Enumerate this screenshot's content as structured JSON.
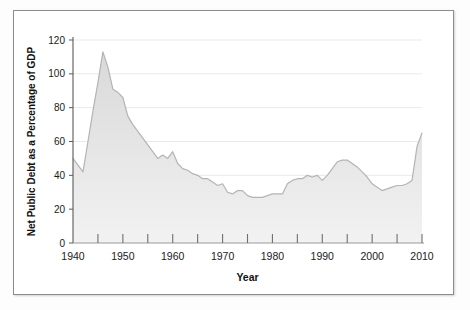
{
  "chart_data": {
    "type": "area",
    "title": "",
    "xlabel": "Year",
    "ylabel": "Net Public Debt as a Percentage of GDP",
    "xlim": [
      1940,
      2010
    ],
    "ylim": [
      0,
      120
    ],
    "grid": true,
    "legend_position": "none",
    "xticks": [
      1940,
      1950,
      1960,
      1970,
      1980,
      1990,
      2000,
      2010
    ],
    "xtick_labels": [
      "1940",
      "1950",
      "1960",
      "1970",
      "1980",
      "1990",
      "2000",
      "2010"
    ],
    "xminor_ticks": [
      1945,
      1955,
      1965,
      1975,
      1985,
      1995,
      2005
    ],
    "yticks": [
      0,
      20,
      40,
      60,
      80,
      100,
      120
    ],
    "ytick_labels": [
      "0",
      "20",
      "40",
      "60",
      "80",
      "100",
      "120"
    ],
    "series": [
      {
        "name": "Net Public Debt as a Percentage of GDP",
        "fill_color": "#e6e6e6",
        "line_color": "#b0b0b0",
        "x": [
          1940,
          1941,
          1942,
          1943,
          1944,
          1945,
          1946,
          1947,
          1948,
          1949,
          1950,
          1951,
          1952,
          1953,
          1954,
          1955,
          1956,
          1957,
          1958,
          1959,
          1960,
          1961,
          1962,
          1963,
          1964,
          1965,
          1966,
          1967,
          1968,
          1969,
          1970,
          1971,
          1972,
          1973,
          1974,
          1975,
          1976,
          1977,
          1978,
          1979,
          1980,
          1981,
          1982,
          1983,
          1984,
          1985,
          1986,
          1987,
          1988,
          1989,
          1990,
          1991,
          1992,
          1993,
          1994,
          1995,
          1996,
          1997,
          1998,
          1999,
          2000,
          2001,
          2002,
          2003,
          2004,
          2005,
          2006,
          2007,
          2008,
          2009,
          2010
        ],
        "y": [
          50.0,
          46.0,
          42.0,
          60.0,
          78.0,
          95.0,
          113.0,
          104.0,
          91.0,
          89.0,
          86.0,
          75.0,
          70.0,
          66.0,
          62.0,
          58.0,
          54.0,
          50.0,
          52.0,
          50.0,
          54.0,
          47.0,
          44.0,
          43.0,
          41.0,
          40.0,
          38.0,
          38.0,
          36.0,
          34.0,
          35.0,
          30.0,
          29.0,
          31.0,
          31.0,
          28.0,
          27.0,
          27.0,
          27.0,
          28.0,
          29.0,
          29.0,
          29.0,
          35.0,
          37.0,
          38.0,
          38.0,
          40.0,
          39.0,
          40.0,
          37.0,
          40.0,
          44.0,
          48.0,
          49.0,
          49.0,
          47.0,
          45.0,
          42.0,
          39.0,
          35.0,
          33.0,
          31.0,
          32.0,
          33.0,
          34.0,
          34.0,
          35.0,
          37.0,
          57.0,
          65.0
        ]
      }
    ]
  },
  "axes": {
    "y_title": "Net Public Debt as a Percentage of GDP",
    "x_title": "Year"
  }
}
